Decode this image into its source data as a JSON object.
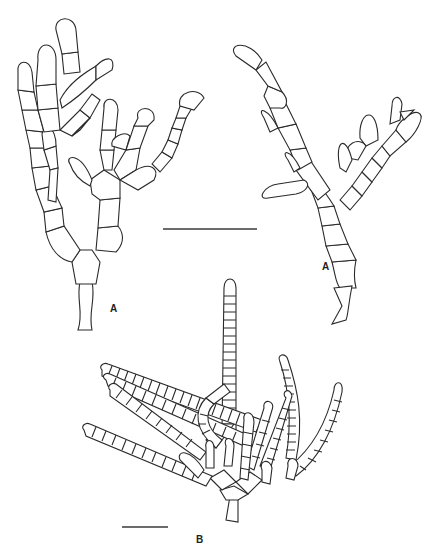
{
  "figure": {
    "panels": [
      {
        "id": "A-left",
        "label": "A",
        "label_pos": [
          110,
          304
        ]
      },
      {
        "id": "A-right",
        "label": "A",
        "label_pos": [
          322,
          262
        ]
      },
      {
        "id": "B",
        "label": "B",
        "label_pos": [
          196,
          535
        ]
      }
    ],
    "scale_bars": [
      {
        "panel": "A",
        "x1": 163,
        "x2": 257,
        "y": 229
      },
      {
        "panel": "B",
        "x1": 122,
        "x2": 168,
        "y": 527
      }
    ],
    "colors": {
      "line": "#2a2a2a",
      "background": "#ffffff"
    }
  }
}
